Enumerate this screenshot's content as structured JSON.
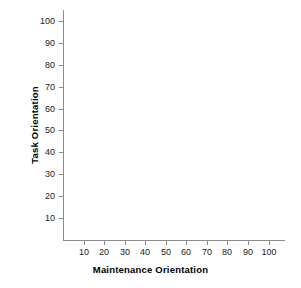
{
  "chart_data": {
    "type": "scatter",
    "title": "",
    "xlabel": "Maintenance Orientation",
    "ylabel": "Task Orientation",
    "xlim": [
      0,
      108
    ],
    "ylim": [
      0,
      105
    ],
    "xticks": [
      10,
      20,
      30,
      40,
      50,
      60,
      70,
      80,
      90,
      100
    ],
    "xtick_labels": [
      "10",
      "20",
      "30",
      "40",
      "50",
      "60",
      "70",
      "80",
      "90",
      "100"
    ],
    "yticks": [
      10,
      20,
      30,
      40,
      50,
      60,
      70,
      80,
      90,
      100
    ],
    "ytick_labels": [
      "10",
      "20",
      "30",
      "40",
      "50",
      "60",
      "70",
      "80",
      "90",
      "100"
    ],
    "grid": false,
    "legend": null,
    "series": [],
    "x": [],
    "y": [],
    "annotations": [],
    "axis_color": "#8c8c8c",
    "text_color": "#1a1a1a",
    "background": "#ffffff"
  },
  "figure": {
    "x_axis_title": "Maintenance Orientation",
    "y_axis_title": "Task Orientation"
  }
}
